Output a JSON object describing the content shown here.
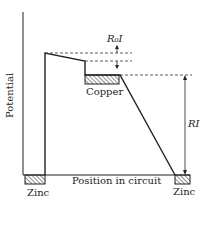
{
  "diagram": {
    "y_axis_label": "Potential",
    "x_axis_label": "Position in circuit",
    "left_electrode_label": "Zinc",
    "right_electrode_label": "Zinc",
    "middle_electrode_label": "Copper",
    "internal_drop_label": "R₀I",
    "external_drop_label": "RI"
  }
}
